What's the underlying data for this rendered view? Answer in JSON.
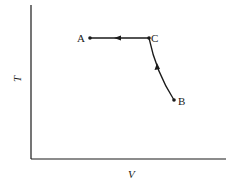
{
  "diagram": {
    "type": "thermodynamic process path (T-V diagram)",
    "axes": {
      "x_label": "V",
      "y_label": "T"
    },
    "points": [
      {
        "label": "A",
        "x": 90,
        "y": 38
      },
      {
        "label": "C",
        "x": 149,
        "y": 38
      },
      {
        "label": "B",
        "x": 174,
        "y": 100
      }
    ],
    "paths": [
      {
        "from": "B",
        "to": "C",
        "shape": "curve",
        "direction": "up"
      },
      {
        "from": "C",
        "to": "A",
        "shape": "horizontal line",
        "direction": "left"
      }
    ],
    "colors": {
      "ink": "#1a1a1a",
      "background": "#ffffff"
    }
  }
}
